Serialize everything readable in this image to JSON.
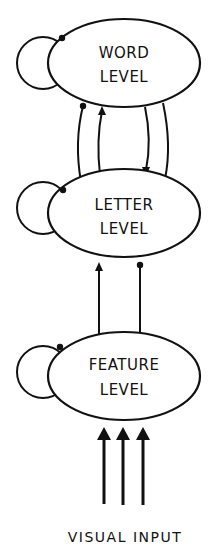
{
  "nodes": {
    "word": {
      "line1": "WORD",
      "line2": "LEVEL"
    },
    "letter": {
      "line1": "LETTER",
      "line2": "LEVEL"
    },
    "feature": {
      "line1": "FEATURE",
      "line2": "LEVEL"
    }
  },
  "input_label": "VISUAL INPUT",
  "connections": [
    {
      "from": "word",
      "to": "word",
      "type": "inhibitory",
      "marker": "dot"
    },
    {
      "from": "letter",
      "to": "letter",
      "type": "inhibitory",
      "marker": "dot"
    },
    {
      "from": "feature",
      "to": "feature",
      "type": "inhibitory",
      "marker": "dot"
    },
    {
      "from": "letter",
      "to": "word",
      "type": "inhibitory",
      "marker": "dot"
    },
    {
      "from": "letter",
      "to": "word",
      "type": "excitatory",
      "marker": "arrow"
    },
    {
      "from": "word",
      "to": "letter",
      "type": "excitatory",
      "marker": "arrow"
    },
    {
      "from": "word",
      "to": "letter",
      "type": "inhibitory",
      "marker": "dot"
    },
    {
      "from": "feature",
      "to": "letter",
      "type": "excitatory",
      "marker": "arrow"
    },
    {
      "from": "feature",
      "to": "letter",
      "type": "inhibitory",
      "marker": "dot"
    },
    {
      "from": "visual-input",
      "to": "feature",
      "type": "excitatory",
      "marker": "arrow",
      "count": 3
    }
  ]
}
